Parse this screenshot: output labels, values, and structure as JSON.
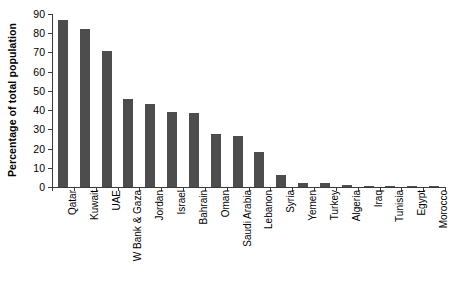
{
  "chart_data": {
    "type": "bar",
    "title": "",
    "subtitle": "",
    "xlabel": "",
    "ylabel": "Percentage of total population",
    "ylim": [
      0,
      90
    ],
    "yticks": [
      0,
      10,
      20,
      30,
      40,
      50,
      60,
      70,
      80,
      90
    ],
    "ytick_labels": [
      "0",
      "10",
      "20",
      "30",
      "40",
      "50",
      "60",
      "70",
      "80",
      "90"
    ],
    "grid": false,
    "legend": null,
    "legend_position": "none",
    "bar_color": "#4d4d4d",
    "axis_color": "#3a3a3a",
    "categories": [
      "Qatar",
      "Kuwait",
      "UAE",
      "W Bank & Gaza",
      "Jordan",
      "Israel",
      "Bahrain",
      "Oman",
      "Saudi Arabia",
      "Lebanon",
      "Syria",
      "Yemen",
      "Turkey",
      "Algeria",
      "Iraq",
      "Tunisia",
      "Egypt",
      "Morocco"
    ],
    "values": [
      87,
      82,
      70.5,
      46,
      43,
      39,
      38.5,
      27.5,
      26.5,
      18,
      6.5,
      2,
      2,
      0.8,
      0.7,
      0.7,
      0.5,
      0.4
    ],
    "annotations": []
  }
}
